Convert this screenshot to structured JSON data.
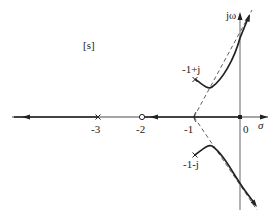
{
  "diagram": {
    "type": "root-locus",
    "plane_label": "[s]",
    "axis_labels": {
      "real": "σ",
      "imag": "jω"
    },
    "tick_labels": [
      "-3",
      "-2",
      "-1",
      "0"
    ],
    "poles": [
      {
        "label": "0",
        "value": "0"
      },
      {
        "label": "-3",
        "value": "-3"
      },
      {
        "label": "-1+j",
        "value": "-1+j"
      },
      {
        "label": "-1-j",
        "value": "-1-j"
      }
    ],
    "zeros": [
      {
        "label": "-2",
        "value": "-2"
      }
    ],
    "asymptote_centroid": "-1",
    "colors": {
      "line": "#222222",
      "axis": "#333333",
      "background": "#ffffff"
    }
  }
}
